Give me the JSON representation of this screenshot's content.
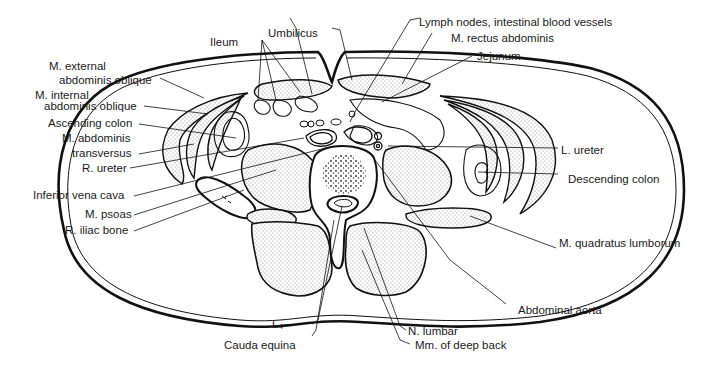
{
  "diagram": {
    "colors": {
      "line": "#111111",
      "stipple": "#9a9a9a",
      "background": "#ffffff"
    },
    "labels_left": [
      {
        "id": "ext-oblique-1",
        "text": "M. external"
      },
      {
        "id": "ext-oblique-2",
        "text": "abdominis oblique"
      },
      {
        "id": "int-oblique-1",
        "text": "M. internal"
      },
      {
        "id": "int-oblique-2",
        "text": "abdominis oblique"
      },
      {
        "id": "ascending-colon",
        "text": "Ascending colon"
      },
      {
        "id": "transversus-1",
        "text": "M. abdominis"
      },
      {
        "id": "transversus-2",
        "text": "transversus"
      },
      {
        "id": "r-ureter",
        "text": "R. ureter"
      },
      {
        "id": "ivc",
        "text": "Inferior vena cava"
      },
      {
        "id": "psoas",
        "text": "M. psoas"
      },
      {
        "id": "iliac",
        "text": "R. iliac bone"
      }
    ],
    "labels_top": [
      {
        "id": "ileum",
        "text": "Ileum"
      },
      {
        "id": "umbilicus",
        "text": "Umbilicus"
      },
      {
        "id": "lymph",
        "text": "Lymph nodes, intestinal blood vessels"
      },
      {
        "id": "rectus",
        "text": "M. rectus abdominis"
      },
      {
        "id": "jejunum",
        "text": "Jejunum"
      }
    ],
    "labels_right": [
      {
        "id": "l-ureter",
        "text": "L. ureter"
      },
      {
        "id": "desc-colon",
        "text": "Descending colon"
      },
      {
        "id": "quadratus",
        "text": "M. quadratus lumborum"
      },
      {
        "id": "aorta",
        "text": "Abdominal aorta"
      }
    ],
    "labels_bottom": [
      {
        "id": "l4",
        "text": "L₄"
      },
      {
        "id": "cauda",
        "text": "Cauda equina"
      },
      {
        "id": "n-lumbar",
        "text": "N. lumbar"
      },
      {
        "id": "deep-back",
        "text": "Mm. of deep back"
      }
    ]
  }
}
